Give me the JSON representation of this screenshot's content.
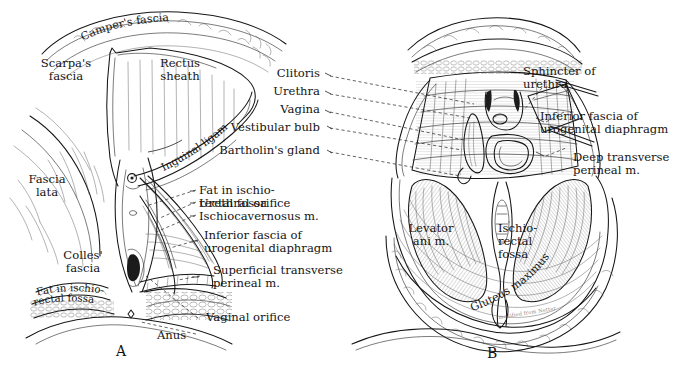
{
  "figure": {
    "ink_color": "#141414",
    "background_color": "#ffffff",
    "attribution": "modified from Netter"
  },
  "panels": [
    {
      "id": "A",
      "letter": "A",
      "labels": [
        {
          "key": "campers_fascia",
          "text": "Camper's fascia"
        },
        {
          "key": "scarpas_fascia",
          "text": "Scarpa's\nfascia"
        },
        {
          "key": "rectus_sheath",
          "text": "Rectus\nsheath"
        },
        {
          "key": "inguinal_ligament",
          "text": "Inguinal ligament"
        },
        {
          "key": "fascia_lata",
          "text": "Fascia\nlata"
        },
        {
          "key": "colles_fascia",
          "text": "Colles'\nfascia"
        },
        {
          "key": "fat_ischiorectal_fossa",
          "text": "Fat in ischio-\nrectal fossa"
        },
        {
          "key": "urethral_orifice",
          "text": "Urethral orifice"
        },
        {
          "key": "ischiocavernosus",
          "text": "Ischiocavernosus m."
        },
        {
          "key": "bulbospongiosus",
          "text": "Bulbospongiosus m."
        },
        {
          "key": "inferior_fascia_ug",
          "text": "Inferior fascia of\nurogenital diaphragm"
        },
        {
          "key": "superficial_transverse",
          "text": "Superficial transverse\nperineal m."
        },
        {
          "key": "vaginal_orifice",
          "text": "Vaginal orifice"
        },
        {
          "key": "anus",
          "text": "Anus"
        }
      ]
    },
    {
      "id": "B",
      "letter": "B",
      "labels": [
        {
          "key": "clitoris",
          "text": "Clitoris"
        },
        {
          "key": "urethra",
          "text": "Urethra"
        },
        {
          "key": "vagina",
          "text": "Vagina"
        },
        {
          "key": "vestibular_bulb",
          "text": "Vestibular bulb"
        },
        {
          "key": "bartholins_gland",
          "text": "Bartholin's gland"
        },
        {
          "key": "sphincter_of_urethra",
          "text": "Sphincter of\nurethra"
        },
        {
          "key": "inferior_fascia_ug",
          "text": "Inferior fascia of\nurogenital diaphragm"
        },
        {
          "key": "deep_transverse",
          "text": "Deep transverse\nperineal m."
        },
        {
          "key": "levator_ani",
          "text": "Levator\nani m."
        },
        {
          "key": "ischiorectal_fossa",
          "text": "Ischio-\nrectal\nfossa"
        },
        {
          "key": "gluteus_maximus",
          "text": "Gluteus maximus m."
        }
      ]
    }
  ]
}
